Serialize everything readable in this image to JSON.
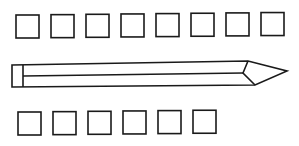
{
  "diagram": {
    "top_row": {
      "square_count": 8
    },
    "pencil": {
      "label": ""
    },
    "bottom_row": {
      "square_count": 6
    },
    "colors": {
      "stroke": "#1a1a1a",
      "background": "#ffffff"
    }
  }
}
